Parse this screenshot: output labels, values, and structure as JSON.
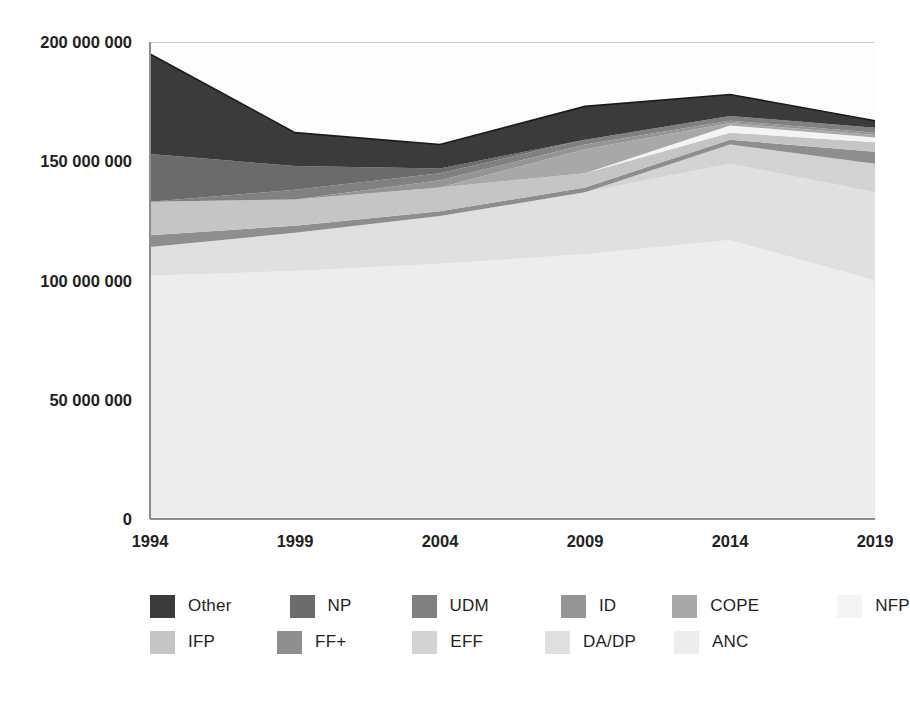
{
  "chart_data": {
    "type": "area",
    "stacked": true,
    "title": "",
    "subtitle": "",
    "xlabel": "",
    "ylabel": "",
    "x": [
      1994,
      1999,
      2004,
      2009,
      2014,
      2019
    ],
    "xtick_labels": [
      "1994",
      "1999",
      "2004",
      "2009",
      "2014",
      "2019"
    ],
    "ytick_labels": [
      "0",
      "50 000 000",
      "100 000 000",
      "150 000 000",
      "200 000 000"
    ],
    "yticks": [
      0,
      50000000,
      100000000,
      150000000,
      200000000
    ],
    "ylim": [
      0,
      200000000
    ],
    "xlim": [
      1994,
      2019
    ],
    "grid": true,
    "grid_axis": "y",
    "legend_position": "bottom",
    "stack_order_bottom_to_top": [
      "ANC",
      "DA/DP",
      "EFF",
      "FF+",
      "IFP",
      "NFP",
      "COPE",
      "ID",
      "UDM",
      "NP",
      "Other"
    ],
    "series": [
      {
        "name": "ANC",
        "color": "#ededed",
        "values": [
          102000000,
          104000000,
          107000000,
          111000000,
          117000000,
          100000000
        ]
      },
      {
        "name": "DA/DP",
        "color": "#e0e0e0",
        "values": [
          12000000,
          16000000,
          20000000,
          26000000,
          32000000,
          37000000
        ]
      },
      {
        "name": "EFF",
        "color": "#d3d3d3",
        "values": [
          0,
          0,
          0,
          0,
          8000000,
          12000000
        ]
      },
      {
        "name": "FF+",
        "color": "#8e8e8e",
        "values": [
          5000000,
          3000000,
          2000000,
          2000000,
          2000000,
          5000000
        ]
      },
      {
        "name": "IFP",
        "color": "#c5c5c5",
        "values": [
          14000000,
          11000000,
          10000000,
          6000000,
          3000000,
          4000000
        ]
      },
      {
        "name": "NFP",
        "color": "#f4f4f4",
        "values": [
          0,
          0,
          0,
          0,
          3000000,
          2000000
        ]
      },
      {
        "name": "COPE",
        "color": "#a8a8a8",
        "values": [
          0,
          0,
          0,
          10000000,
          1000000,
          1000000
        ]
      },
      {
        "name": "ID",
        "color": "#959595",
        "values": [
          0,
          0,
          3000000,
          2000000,
          1000000,
          1000000
        ]
      },
      {
        "name": "UDM",
        "color": "#808080",
        "values": [
          0,
          4000000,
          3000000,
          2000000,
          2000000,
          2000000
        ]
      },
      {
        "name": "NP",
        "color": "#6b6b6b",
        "values": [
          20000000,
          10000000,
          2000000,
          0,
          0,
          0
        ]
      },
      {
        "name": "Other",
        "color": "#3b3b3b",
        "values": [
          42000000,
          14000000,
          10000000,
          14000000,
          9000000,
          3000000
        ]
      }
    ],
    "totals": [
      195000000,
      162000000,
      157000000,
      173000000,
      178000000,
      167000000
    ]
  },
  "legend": {
    "rows": [
      [
        {
          "label": "Other",
          "color": "#3b3b3b"
        },
        {
          "label": "NP",
          "color": "#6b6b6b"
        },
        {
          "label": "UDM",
          "color": "#808080"
        },
        {
          "label": "ID",
          "color": "#959595"
        },
        {
          "label": "COPE",
          "color": "#a8a8a8"
        },
        {
          "label": "NFP",
          "color": "#f4f4f4"
        }
      ],
      [
        {
          "label": "IFP",
          "color": "#c5c5c5"
        },
        {
          "label": "FF+",
          "color": "#8e8e8e"
        },
        {
          "label": "EFF",
          "color": "#d3d3d3"
        },
        {
          "label": "DA/DP",
          "color": "#e0e0e0"
        },
        {
          "label": "ANC",
          "color": "#ededed"
        }
      ]
    ]
  },
  "axes": {
    "grid_color": "#c9c9c9",
    "axis_color": "#8d8d8d",
    "text_color": "#231f20"
  }
}
